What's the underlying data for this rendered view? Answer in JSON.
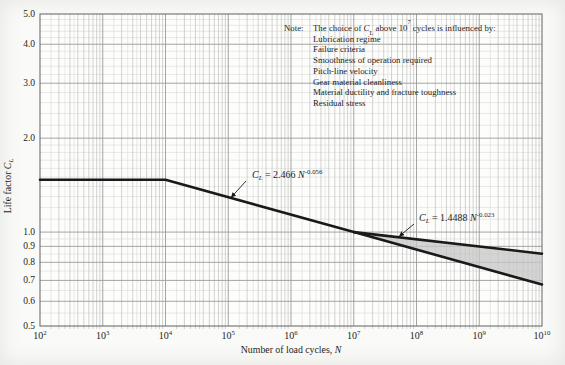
{
  "note": {
    "label": "Note:",
    "intro": {
      "pre": "The choice of ",
      "var": "C",
      "var_sub": "L",
      "mid": " above 10",
      "sup": "7",
      "post": " cycles is influenced by:"
    },
    "items": [
      "Lubrication regime",
      "Failure criteria",
      "Smoothness of operation required",
      "Pitch-line velocity",
      "Gear material cleanliness",
      "Material ductility and fracture toughness",
      "Residual stress"
    ]
  },
  "chart_data": {
    "type": "line",
    "x_scale": "log",
    "y_scale": "log",
    "xlim": [
      100,
      10000000000
    ],
    "ylim": [
      0.5,
      5.0
    ],
    "xlabel": {
      "text": "Number of load cycles, ",
      "var": "N"
    },
    "ylabel": {
      "text": "Life factor ",
      "var": "C",
      "var_sub": "L"
    },
    "x_tick_exponents": [
      2,
      3,
      4,
      5,
      6,
      7,
      8,
      9,
      10
    ],
    "y_ticks": [
      5.0,
      4.0,
      3.0,
      2.0,
      1.0,
      0.9,
      0.8,
      0.7,
      0.6,
      0.5
    ],
    "grid": "log-log fine grid, on",
    "legend": "none",
    "series": [
      {
        "name": "CL = 2.466 N^-0.056",
        "equation": {
          "lhs_var": "C",
          "lhs_sub": "L",
          "coef": "2.466",
          "var": "N",
          "exponent": "-0.056"
        },
        "points": [
          [
            100,
            1.4722
          ],
          [
            10000,
            1.4722
          ],
          [
            10000000,
            1.0
          ],
          [
            10000000000,
            0.6793
          ]
        ]
      },
      {
        "name": "CL = 1.4488 N^-0.023",
        "equation": {
          "lhs_var": "C",
          "lhs_sub": "L",
          "coef": "1.4488",
          "var": "N",
          "exponent": "-0.023"
        },
        "points": [
          [
            10000000,
            1.0
          ],
          [
            10000000000,
            0.8527
          ]
        ]
      }
    ],
    "shaded_region": {
      "description": "band between the two curves from 1e7 to 1e10 cycles",
      "x_range": [
        10000000,
        10000000000
      ]
    },
    "colors": {
      "curve": "#1a1a1a",
      "shade": "#c6c6c6",
      "grid_minor": "#d8dad8",
      "grid_mid": "#bfc1bf",
      "grid_major": "#9a9c9a",
      "border": "#6d6f6d",
      "text": "#1d1d1d"
    }
  }
}
